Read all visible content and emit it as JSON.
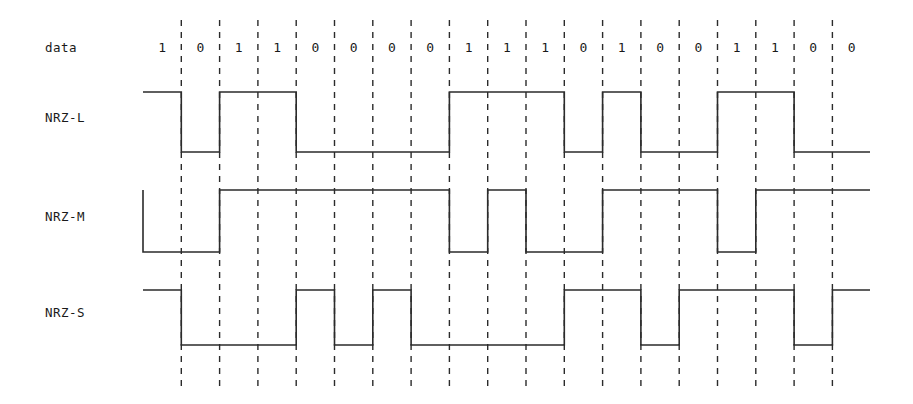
{
  "figure": {
    "type": "timing-diagram",
    "title": "",
    "background": "#ffffff",
    "line_color": "#2b2b2b"
  },
  "rows": [
    {
      "key": "data",
      "label": "data"
    },
    {
      "key": "nrzl",
      "label": "NRZ-L"
    },
    {
      "key": "nrzm",
      "label": "NRZ-M"
    },
    {
      "key": "nrzs",
      "label": "NRZ-S"
    }
  ],
  "data_bits": [
    "1",
    "0",
    "1",
    "1",
    "0",
    "0",
    "0",
    "0",
    "1",
    "1",
    "1",
    "0",
    "1",
    "0",
    "0",
    "1",
    "1",
    "0",
    "0"
  ],
  "chart_data": {
    "type": "line",
    "xlabel": "",
    "ylabel": "",
    "categories": [
      "1",
      "0",
      "1",
      "1",
      "0",
      "0",
      "0",
      "0",
      "1",
      "1",
      "1",
      "0",
      "1",
      "0",
      "0",
      "1",
      "1",
      "0",
      "0"
    ],
    "legend_position": "left",
    "grid": true,
    "axis_ranges": {
      "x": [
        0,
        19
      ],
      "y": [
        0,
        1
      ]
    },
    "series": [
      {
        "name": "NRZ-L",
        "rule": "high for 1, low for 0",
        "levels": [
          1,
          0,
          1,
          1,
          0,
          0,
          0,
          0,
          1,
          1,
          1,
          0,
          1,
          0,
          0,
          1,
          1,
          0,
          0
        ]
      },
      {
        "name": "NRZ-M",
        "rule": "transition on 1, no transition on 0",
        "initial_level": 1,
        "levels": [
          0,
          0,
          1,
          1,
          1,
          1,
          1,
          1,
          0,
          1,
          0,
          0,
          1,
          1,
          1,
          0,
          1,
          1,
          1
        ]
      },
      {
        "name": "NRZ-S",
        "rule": "transition on 0, no transition on 1",
        "initial_level": 1,
        "levels": [
          1,
          0,
          0,
          0,
          1,
          0,
          1,
          0,
          0,
          0,
          0,
          1,
          1,
          0,
          1,
          1,
          1,
          0,
          1
        ]
      }
    ]
  },
  "geometry": {
    "bit_width": 38.3,
    "x_start": 143,
    "x_first_boundary": 182,
    "x_end": 870,
    "grid_top": 20,
    "grid_bottom": 386,
    "label_x": 45,
    "bit_label_y": 52,
    "nrzl_high_y": 92,
    "nrzl_low_y": 152,
    "nrzm_high_y": 190,
    "nrzm_low_y": 252,
    "nrzs_high_y": 290,
    "nrzs_low_y": 345,
    "label_y": {
      "data": 52,
      "nrzl": 122,
      "nrzm": 221,
      "nrzs": 317
    }
  }
}
